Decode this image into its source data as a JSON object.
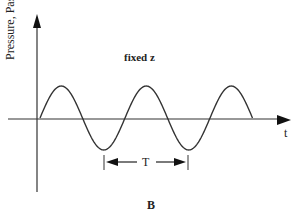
{
  "figure": {
    "panel_label": "B",
    "annotation": "fixed z",
    "y_axis_label": "Pressure, Pascal",
    "x_axis_label": "t",
    "period_label": "T"
  },
  "chart_data": {
    "type": "line",
    "title": "fixed z",
    "xlabel": "t",
    "ylabel": "Pressure, Pascal",
    "panel": "B",
    "series": [
      {
        "name": "pressure",
        "function": "sin",
        "cycles": 2.5,
        "x": [
          0,
          0.25,
          0.5,
          0.75,
          1.0,
          1.25,
          1.5,
          1.75,
          2.0,
          2.25,
          2.5
        ],
        "values": [
          0,
          1,
          0,
          -1,
          0,
          1,
          0,
          -1,
          0,
          1,
          0
        ]
      }
    ],
    "annotations": [
      {
        "type": "period-arrow",
        "label": "T",
        "from_trough": 1,
        "to_trough": 2
      }
    ],
    "grid": false,
    "legend": null
  },
  "colors": {
    "line": "#333333",
    "background": "#ffffff"
  }
}
